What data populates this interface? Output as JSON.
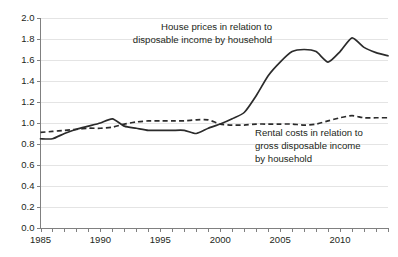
{
  "chart_data": {
    "type": "line",
    "title": "",
    "subtitle": "",
    "xlabel": "",
    "ylabel": "",
    "xlim": [
      1985,
      2014
    ],
    "ylim": [
      0.0,
      2.0
    ],
    "grid": true,
    "legend_position": "inline-annotations",
    "x": [
      1985,
      1986,
      1987,
      1988,
      1989,
      1990,
      1991,
      1992,
      1993,
      1994,
      1995,
      1996,
      1997,
      1998,
      1999,
      2000,
      2001,
      2002,
      2003,
      2004,
      2005,
      2006,
      2007,
      2008,
      2009,
      2010,
      2011,
      2012,
      2013,
      2014
    ],
    "y_ticks": [
      0.0,
      0.2,
      0.4,
      0.6,
      0.8,
      1.0,
      1.2,
      1.4,
      1.6,
      1.8,
      2.0
    ],
    "y_tick_labels": [
      "0.0",
      "0.2",
      "0.4",
      "0.6",
      "0.8",
      "1.0",
      "1.2",
      "1.4",
      "1.6",
      "1.8",
      "2.0"
    ],
    "x_ticks": [
      1985,
      1990,
      1995,
      2000,
      2005,
      2010
    ],
    "x_tick_labels": [
      "1985",
      "1990",
      "1995",
      "2000",
      "2005",
      "2010"
    ],
    "series": [
      {
        "name": "House prices in relation to disposable income by household",
        "style": "solid",
        "color": "#2b2b2b",
        "values": [
          0.85,
          0.85,
          0.9,
          0.94,
          0.97,
          1.0,
          1.04,
          0.97,
          0.95,
          0.93,
          0.93,
          0.93,
          0.93,
          0.9,
          0.95,
          0.99,
          1.04,
          1.1,
          1.26,
          1.45,
          1.58,
          1.68,
          1.7,
          1.68,
          1.58,
          1.68,
          1.81,
          1.72,
          1.67,
          1.64
        ]
      },
      {
        "name": "Rental costs in relation to gross disposable income by household",
        "style": "dashed",
        "color": "#2b2b2b",
        "values": [
          0.91,
          0.92,
          0.93,
          0.94,
          0.95,
          0.95,
          0.96,
          0.99,
          1.01,
          1.02,
          1.02,
          1.02,
          1.02,
          1.03,
          1.03,
          0.99,
          0.98,
          0.98,
          0.99,
          0.99,
          0.99,
          0.99,
          0.98,
          0.99,
          1.02,
          1.05,
          1.07,
          1.05,
          1.05,
          1.05
        ]
      }
    ],
    "annotations": [
      {
        "id": "house-prices-annotation",
        "lines": [
          "House prices in relation to",
          "disposable income by household"
        ],
        "anchor": "end"
      },
      {
        "id": "rental-costs-annotation",
        "lines": [
          "Rental costs in relation to",
          "gross disposable income",
          "by household"
        ],
        "anchor": "start"
      }
    ]
  }
}
